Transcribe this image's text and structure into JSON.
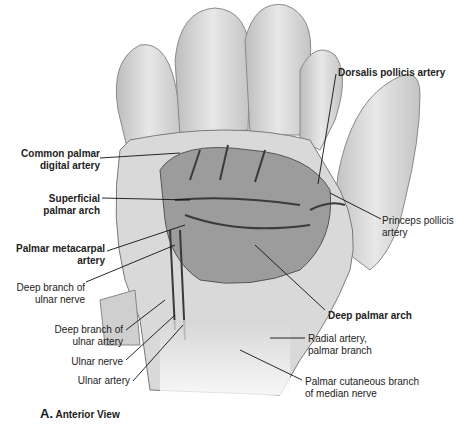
{
  "figure": {
    "caption_letter": "A.",
    "caption_text": "Anterior View",
    "labels": {
      "common_palmar_digital_artery": [
        "Common palmar",
        "digital artery"
      ],
      "superficial_palmar_arch": [
        "Superficial",
        "palmar arch"
      ],
      "palmar_metacarpal_artery": [
        "Palmar metacarpal",
        "artery"
      ],
      "deep_branch_ulnar_nerve": [
        "Deep branch of",
        "ulnar nerve"
      ],
      "deep_branch_ulnar_artery": [
        "Deep branch of",
        "ulnar artery"
      ],
      "ulnar_nerve": "Ulnar nerve",
      "ulnar_artery": "Ulnar artery",
      "dorsalis_pollicis_artery": "Dorsalis pollicis artery",
      "princeps_pollicis_artery": [
        "Princeps pollicis",
        "artery"
      ],
      "deep_palmar_arch": "Deep palmar arch",
      "radial_artery_palmar_branch": [
        "Radial artery,",
        "palmar branch"
      ],
      "palmar_cutaneous_branch_median_nerve": [
        "Palmar cutaneous branch",
        "of median nerve"
      ]
    }
  }
}
